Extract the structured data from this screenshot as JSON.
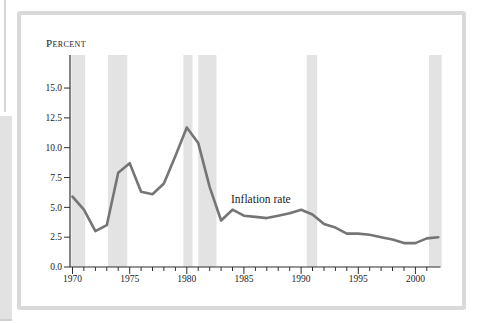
{
  "figure": {
    "percent_label": "Percent",
    "series_label": "Inflation rate"
  },
  "chart_data": {
    "type": "line",
    "title": "",
    "ylabel": "Percent",
    "series_label": "Inflation rate",
    "x": [
      1970,
      1971,
      1972,
      1973,
      1974,
      1975,
      1976,
      1977,
      1978,
      1979,
      1980,
      1981,
      1982,
      1983,
      1984,
      1985,
      1986,
      1987,
      1988,
      1989,
      1990,
      1991,
      1992,
      1993,
      1994,
      1995,
      1996,
      1997,
      1998,
      1999,
      2000,
      2001,
      2002
    ],
    "values": [
      5.9,
      4.8,
      3.0,
      3.5,
      7.9,
      8.7,
      6.3,
      6.1,
      7.0,
      9.3,
      11.7,
      10.4,
      6.7,
      3.9,
      4.8,
      4.3,
      4.2,
      4.1,
      4.3,
      4.5,
      4.8,
      4.4,
      3.6,
      3.3,
      2.8,
      2.8,
      2.7,
      2.5,
      2.3,
      2.0,
      2.0,
      2.4,
      2.5
    ],
    "y_ticks": [
      0.0,
      2.5,
      5.0,
      7.5,
      10.0,
      12.5,
      15.0
    ],
    "y_tick_labels": [
      "0.0",
      "2.5",
      "5.0",
      "7.5",
      "10.0",
      "12.5",
      "15.0"
    ],
    "x_label_years": [
      1970,
      1975,
      1980,
      1985,
      1990,
      1995,
      2000
    ],
    "x_tick_labels": [
      "1970",
      "1975",
      "1980",
      "1985",
      "1990",
      "1995",
      "2000"
    ],
    "minor_tick_years": [
      1970,
      2001
    ],
    "xlim": [
      1969.78,
      2002.3
    ],
    "ylim": [
      0,
      17.8
    ],
    "grid": false,
    "legend_position": "inline-annotation",
    "recession_bands": [
      [
        1969.9,
        1971.1
      ],
      [
        1973.1,
        1974.8
      ],
      [
        1979.7,
        1980.5
      ],
      [
        1981.0,
        1982.6
      ],
      [
        1990.5,
        1991.4
      ],
      [
        2001.2,
        2002.3
      ]
    ],
    "colors": {
      "line": "#757575",
      "band": "#e3e3e3",
      "axis": "#2f2f2f",
      "frame": "#d9d9d9",
      "text": "#1c1c1c"
    }
  }
}
